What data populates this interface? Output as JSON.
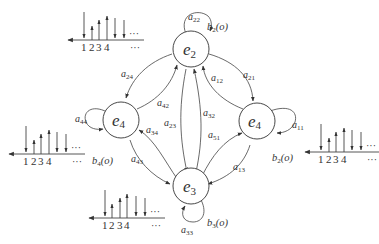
{
  "diagram": {
    "type": "hidden-markov-model-state-transition",
    "nodes": [
      {
        "id": "e2_top",
        "label": "e",
        "sub": "2"
      },
      {
        "id": "e4_left",
        "label": "e",
        "sub": "4"
      },
      {
        "id": "e4_right",
        "label": "e",
        "sub": "4"
      },
      {
        "id": "e3_bottom",
        "label": "e",
        "sub": "3"
      }
    ],
    "edges": [
      {
        "from": "e2_top",
        "to": "e2_top",
        "label": "a",
        "sub": "22"
      },
      {
        "from": "e2_top",
        "to": "e4_left",
        "label": "a",
        "sub": "24"
      },
      {
        "from": "e4_left",
        "to": "e2_top",
        "label": "a",
        "sub": "42"
      },
      {
        "from": "e2_top",
        "to": "e4_right",
        "label": "a",
        "sub": "21"
      },
      {
        "from": "e4_right",
        "to": "e2_top",
        "label": "a",
        "sub": "12"
      },
      {
        "from": "e2_top",
        "to": "e3_bottom",
        "label": "a",
        "sub": "23"
      },
      {
        "from": "e3_bottom",
        "to": "e2_top",
        "label": "a",
        "sub": "32"
      },
      {
        "from": "e4_left",
        "to": "e4_left",
        "label": "a",
        "sub": "44"
      },
      {
        "from": "e3_bottom",
        "to": "e4_left",
        "label": "a",
        "sub": "34"
      },
      {
        "from": "e4_left",
        "to": "e3_bottom",
        "label": "a",
        "sub": "43"
      },
      {
        "from": "e4_right",
        "to": "e4_right",
        "label": "a",
        "sub": "11"
      },
      {
        "from": "e3_bottom",
        "to": "e4_right",
        "label": "a",
        "sub": "51"
      },
      {
        "from": "e4_right",
        "to": "e3_bottom",
        "label": "a",
        "sub": "13"
      },
      {
        "from": "e3_bottom",
        "to": "e3_bottom",
        "label": "a",
        "sub": "33"
      }
    ],
    "emissions": [
      {
        "node": "e2_top",
        "label": "b",
        "sub": "2",
        "arg": "(o)",
        "ticks": [
          "1",
          "2",
          "3",
          "4"
        ],
        "ellipsis": "···"
      },
      {
        "node": "e4_left",
        "label": "b",
        "sub": "4",
        "arg": "(o)",
        "ticks": [
          "1",
          "2",
          "3",
          "4"
        ],
        "ellipsis": "···"
      },
      {
        "node": "e4_right",
        "label": "b",
        "sub": "2",
        "arg": "(o)",
        "ticks": [
          "1",
          "2",
          "3",
          "4"
        ],
        "ellipsis": "···"
      },
      {
        "node": "e3_bottom",
        "label": "b",
        "sub": "3",
        "arg": "(o)",
        "ticks": [
          "1",
          "2",
          "3",
          "4"
        ],
        "ellipsis": "···"
      }
    ],
    "spectrum_bars": [
      "down-long",
      "up-short",
      "up-medium",
      "up-long",
      "down-medium",
      "down-medium"
    ]
  }
}
